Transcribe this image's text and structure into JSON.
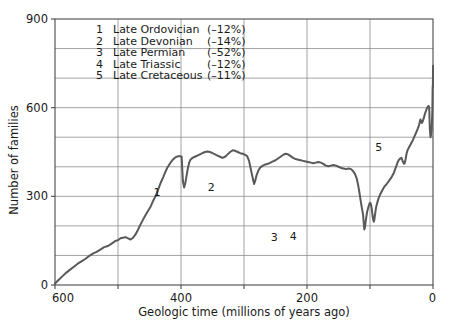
{
  "chart_data": {
    "type": "line",
    "title": "",
    "xlabel": "Geologic time (millions of years ago)",
    "ylabel": "Number of families",
    "xlim": [
      600,
      0
    ],
    "ylim": [
      0,
      900
    ],
    "x_ticks_labeled": [
      600,
      400,
      200,
      0
    ],
    "x_ticks_all": [
      600,
      500,
      400,
      300,
      200,
      100,
      0
    ],
    "y_ticks_labeled": [
      0,
      300,
      600,
      900
    ],
    "y_ticks_all": [
      0,
      100,
      200,
      300,
      400,
      500,
      600,
      700,
      800,
      900
    ],
    "x_axis_reversed": true,
    "grid": true,
    "grid_orientation": "both",
    "legend_position": "upper-left-inside",
    "series": [
      {
        "name": "Number of marine families",
        "color": "#595959",
        "points": [
          [
            600,
            5
          ],
          [
            594,
            18
          ],
          [
            588,
            30
          ],
          [
            582,
            42
          ],
          [
            576,
            52
          ],
          [
            570,
            62
          ],
          [
            564,
            72
          ],
          [
            558,
            80
          ],
          [
            552,
            88
          ],
          [
            546,
            98
          ],
          [
            540,
            106
          ],
          [
            534,
            112
          ],
          [
            528,
            120
          ],
          [
            522,
            128
          ],
          [
            516,
            132
          ],
          [
            510,
            140
          ],
          [
            505,
            148
          ],
          [
            500,
            152
          ],
          [
            496,
            158
          ],
          [
            492,
            160
          ],
          [
            488,
            162
          ],
          [
            484,
            158
          ],
          [
            480,
            154
          ],
          [
            476,
            160
          ],
          [
            472,
            172
          ],
          [
            468,
            188
          ],
          [
            464,
            206
          ],
          [
            460,
            222
          ],
          [
            456,
            238
          ],
          [
            452,
            252
          ],
          [
            449,
            262
          ],
          [
            446,
            276
          ],
          [
            443,
            290
          ],
          [
            440,
            302
          ],
          [
            437,
            318
          ],
          [
            434,
            336
          ],
          [
            431,
            352
          ],
          [
            428,
            366
          ],
          [
            425,
            382
          ],
          [
            422,
            396
          ],
          [
            419,
            406
          ],
          [
            416,
            416
          ],
          [
            413,
            424
          ],
          [
            410,
            430
          ],
          [
            407,
            434
          ],
          [
            404,
            436
          ],
          [
            401,
            436
          ],
          [
            399,
            434
          ],
          [
            397,
            352
          ],
          [
            395,
            330
          ],
          [
            393,
            346
          ],
          [
            391,
            372
          ],
          [
            389,
            396
          ],
          [
            387,
            414
          ],
          [
            385,
            424
          ],
          [
            382,
            430
          ],
          [
            378,
            434
          ],
          [
            374,
            438
          ],
          [
            370,
            442
          ],
          [
            366,
            446
          ],
          [
            362,
            450
          ],
          [
            358,
            452
          ],
          [
            354,
            450
          ],
          [
            350,
            446
          ],
          [
            346,
            442
          ],
          [
            342,
            438
          ],
          [
            338,
            434
          ],
          [
            334,
            430
          ],
          [
            330,
            434
          ],
          [
            326,
            442
          ],
          [
            322,
            450
          ],
          [
            318,
            456
          ],
          [
            314,
            454
          ],
          [
            310,
            450
          ],
          [
            306,
            446
          ],
          [
            302,
            444
          ],
          [
            298,
            440
          ],
          [
            295,
            436
          ],
          [
            292,
            420
          ],
          [
            289,
            390
          ],
          [
            286,
            360
          ],
          [
            284,
            342
          ],
          [
            282,
            354
          ],
          [
            280,
            372
          ],
          [
            277,
            388
          ],
          [
            274,
            398
          ],
          [
            270,
            404
          ],
          [
            266,
            408
          ],
          [
            262,
            410
          ],
          [
            258,
            414
          ],
          [
            254,
            418
          ],
          [
            250,
            422
          ],
          [
            246,
            428
          ],
          [
            242,
            434
          ],
          [
            238,
            440
          ],
          [
            234,
            444
          ],
          [
            230,
            442
          ],
          [
            226,
            436
          ],
          [
            222,
            430
          ],
          [
            218,
            426
          ],
          [
            214,
            424
          ],
          [
            210,
            422
          ],
          [
            206,
            420
          ],
          [
            202,
            418
          ],
          [
            198,
            416
          ],
          [
            194,
            414
          ],
          [
            190,
            412
          ],
          [
            186,
            414
          ],
          [
            182,
            416
          ],
          [
            178,
            414
          ],
          [
            174,
            410
          ],
          [
            170,
            404
          ],
          [
            166,
            402
          ],
          [
            162,
            404
          ],
          [
            158,
            406
          ],
          [
            154,
            404
          ],
          [
            150,
            400
          ],
          [
            146,
            396
          ],
          [
            142,
            394
          ],
          [
            138,
            392
          ],
          [
            134,
            394
          ],
          [
            130,
            392
          ],
          [
            127,
            386
          ],
          [
            124,
            376
          ],
          [
            121,
            360
          ],
          [
            119,
            340
          ],
          [
            117,
            316
          ],
          [
            115,
            288
          ],
          [
            113,
            262
          ],
          [
            111,
            238
          ],
          [
            110,
            212
          ],
          [
            109,
            188
          ],
          [
            108,
            195
          ],
          [
            107,
            212
          ],
          [
            106,
            228
          ],
          [
            105,
            242
          ],
          [
            104,
            252
          ],
          [
            103,
            260
          ],
          [
            102,
            268
          ],
          [
            101,
            274
          ],
          [
            100,
            278
          ],
          [
            99,
            276
          ],
          [
            98,
            268
          ],
          [
            97,
            254
          ],
          [
            96,
            236
          ],
          [
            95,
            222
          ],
          [
            94,
            214
          ],
          [
            93,
            222
          ],
          [
            92,
            238
          ],
          [
            91,
            254
          ],
          [
            90,
            266
          ],
          [
            88,
            282
          ],
          [
            86,
            296
          ],
          [
            84,
            306
          ],
          [
            82,
            314
          ],
          [
            80,
            322
          ],
          [
            78,
            330
          ],
          [
            76,
            336
          ],
          [
            74,
            340
          ],
          [
            72,
            346
          ],
          [
            70,
            352
          ],
          [
            68,
            358
          ],
          [
            66,
            364
          ],
          [
            64,
            372
          ],
          [
            62,
            380
          ],
          [
            60,
            392
          ],
          [
            58,
            404
          ],
          [
            56,
            416
          ],
          [
            54,
            424
          ],
          [
            52,
            428
          ],
          [
            50,
            430
          ],
          [
            48,
            418
          ],
          [
            46,
            410
          ],
          [
            45,
            412
          ],
          [
            44,
            420
          ],
          [
            43,
            432
          ],
          [
            42,
            444
          ],
          [
            41,
            452
          ],
          [
            40,
            458
          ],
          [
            38,
            466
          ],
          [
            36,
            474
          ],
          [
            34,
            482
          ],
          [
            32,
            490
          ],
          [
            30,
            500
          ],
          [
            28,
            510
          ],
          [
            26,
            520
          ],
          [
            24,
            530
          ],
          [
            22,
            542
          ],
          [
            21,
            552
          ],
          [
            20,
            560
          ],
          [
            19,
            556
          ],
          [
            18,
            548
          ],
          [
            17,
            550
          ],
          [
            16,
            556
          ],
          [
            15,
            562
          ],
          [
            14,
            570
          ],
          [
            13,
            578
          ],
          [
            12,
            584
          ],
          [
            11,
            590
          ],
          [
            10,
            596
          ],
          [
            9,
            600
          ],
          [
            8,
            604
          ],
          [
            7,
            606
          ],
          [
            6,
            600
          ],
          [
            5,
            528
          ],
          [
            4,
            500
          ],
          [
            3,
            508
          ],
          [
            2,
            530
          ],
          [
            1.5,
            560
          ],
          [
            1,
            596
          ],
          [
            0.8,
            630
          ],
          [
            0.6,
            660
          ],
          [
            0.5,
            672
          ],
          [
            0.4,
            676
          ],
          [
            0.3,
            674
          ],
          [
            0.2,
            668
          ],
          [
            0.15,
            670
          ],
          [
            0.1,
            680
          ],
          [
            0.08,
            692
          ],
          [
            0.06,
            700
          ],
          [
            0.04,
            704
          ],
          [
            0.03,
            700
          ],
          [
            0.02,
            698
          ],
          [
            0.015,
            702
          ],
          [
            0.01,
            710
          ],
          [
            0.008,
            718
          ],
          [
            0.005,
            726
          ],
          [
            0.003,
            732
          ],
          [
            0.001,
            738
          ],
          [
            0,
            742
          ]
        ]
      }
    ],
    "annotations": [
      {
        "id": "1",
        "label": "1",
        "x": 438,
        "y": 300
      },
      {
        "id": "2",
        "label": "2",
        "x": 352,
        "y": 318
      },
      {
        "id": "3",
        "label": "3",
        "x": 252,
        "y": 148
      },
      {
        "id": "4",
        "label": "4",
        "x": 222,
        "y": 152
      },
      {
        "id": "5",
        "label": "5",
        "x": 86,
        "y": 452
      }
    ],
    "legend_entries": [
      {
        "number": "1",
        "name": "Late Ordovician",
        "percent": "(–12%)"
      },
      {
        "number": "2",
        "name": "Late Devonian",
        "percent": "(–14%)"
      },
      {
        "number": "3",
        "name": "Late Permian",
        "percent": "(–52%)"
      },
      {
        "number": "4",
        "name": "Late Triassic",
        "percent": "(–12%)"
      },
      {
        "number": "5",
        "name": "Late Cretaceous",
        "percent": "(–11%)"
      }
    ],
    "colors": {
      "curve": "#595959",
      "grid": "#8c8c8c",
      "axis": "#4a4a4a",
      "text": "#1a1a1a",
      "background": "#ffffff"
    }
  }
}
